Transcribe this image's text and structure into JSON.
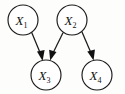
{
  "figure": {
    "kind": "directed-acyclic-graph",
    "background_color": "#fdfdfb",
    "stroke_color": "#1a1a1a",
    "node_fill": "#ffffff",
    "width": 125,
    "height": 94
  },
  "graph_data": {
    "type": "diagram",
    "subtype": "bayesian-network-dag",
    "title": "",
    "nodes": [
      {
        "id": "X1",
        "base": "X",
        "subscript": "1",
        "label": "X₁",
        "cx": 23,
        "cy": 20,
        "r": 15
      },
      {
        "id": "X2",
        "base": "X",
        "subscript": "2",
        "label": "X₂",
        "cx": 72,
        "cy": 20,
        "r": 15
      },
      {
        "id": "X3",
        "base": "X",
        "subscript": "3",
        "label": "X₃",
        "cx": 46,
        "cy": 75,
        "r": 15
      },
      {
        "id": "X4",
        "base": "X",
        "subscript": "4",
        "label": "X₄",
        "cx": 97,
        "cy": 75,
        "r": 15
      }
    ],
    "edges": [
      {
        "id": "e1",
        "from": "X1",
        "to": "X3",
        "directed": true,
        "arrowhead": "filled-triangle"
      },
      {
        "id": "e2",
        "from": "X2",
        "to": "X3",
        "directed": true,
        "arrowhead": "filled-triangle"
      },
      {
        "id": "e3",
        "from": "X2",
        "to": "X4",
        "directed": true,
        "arrowhead": "filled-triangle"
      }
    ]
  },
  "nodes": {
    "x1": {
      "label": "X",
      "sub": "1"
    },
    "x2": {
      "label": "X",
      "sub": "2"
    },
    "x3": {
      "label": "X",
      "sub": "3"
    },
    "x4": {
      "label": "X",
      "sub": "4"
    }
  }
}
